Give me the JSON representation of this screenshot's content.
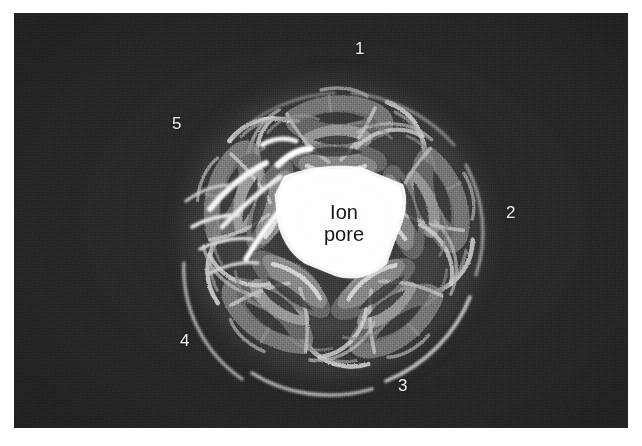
{
  "figure": {
    "kind": "protein-ribbon-micrograph",
    "panel": {
      "background_color": "#2b2b2b",
      "ribbon_light_color": "#f2f2f2",
      "ribbon_mid_color": "#9a9a9a",
      "ribbon_dark_color": "#4a4a4a",
      "pore_fill_color": "#ffffff",
      "pore_text_color": "#161616"
    },
    "pore": {
      "label_line1": "Ion",
      "label_line2": "pore"
    },
    "subunit_labels": [
      {
        "text": "1",
        "x": 355,
        "y": 40,
        "position": "top"
      },
      {
        "text": "2",
        "x": 506,
        "y": 204,
        "position": "right"
      },
      {
        "text": "3",
        "x": 398,
        "y": 377,
        "position": "bottom-right"
      },
      {
        "text": "4",
        "x": 180,
        "y": 332,
        "position": "bottom-left"
      },
      {
        "text": "5",
        "x": 172,
        "y": 115,
        "position": "top-left"
      }
    ]
  }
}
